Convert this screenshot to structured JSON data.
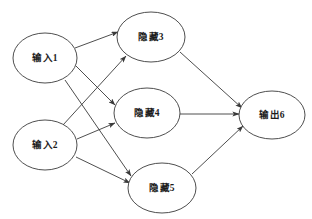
{
  "diagram": {
    "type": "neural-network",
    "title": "",
    "background_color": "#ffffff",
    "stroke_color": "#3a3a3a",
    "text_color": "#1c1c1c",
    "nodes": [
      {
        "id": "n1",
        "label": "输入1",
        "layer": "input",
        "cx": 45,
        "cy": 58,
        "rx": 32,
        "ry": 25
      },
      {
        "id": "n2",
        "label": "输入2",
        "layer": "input",
        "cx": 45,
        "cy": 145,
        "rx": 32,
        "ry": 25
      },
      {
        "id": "n3",
        "label": "隐藏3",
        "layer": "hidden",
        "cx": 151,
        "cy": 37,
        "rx": 34,
        "ry": 25
      },
      {
        "id": "n4",
        "label": "隐藏4",
        "layer": "hidden",
        "cx": 147,
        "cy": 113,
        "rx": 33,
        "ry": 25
      },
      {
        "id": "n5",
        "label": "隐藏5",
        "layer": "hidden",
        "cx": 162,
        "cy": 188,
        "rx": 34,
        "ry": 25
      },
      {
        "id": "n6",
        "label": "输出6",
        "layer": "output",
        "cx": 272,
        "cy": 115,
        "rx": 33,
        "ry": 24
      }
    ],
    "edges": [
      {
        "id": "e1",
        "from": "n1",
        "to": "n3",
        "directed": true
      },
      {
        "id": "e2",
        "from": "n1",
        "to": "n4",
        "directed": true
      },
      {
        "id": "e3",
        "from": "n1",
        "to": "n5",
        "directed": true
      },
      {
        "id": "e4",
        "from": "n2",
        "to": "n3",
        "directed": true
      },
      {
        "id": "e5",
        "from": "n2",
        "to": "n4",
        "directed": true
      },
      {
        "id": "e6",
        "from": "n2",
        "to": "n5",
        "directed": true
      },
      {
        "id": "e7",
        "from": "n3",
        "to": "n6",
        "directed": true
      },
      {
        "id": "e8",
        "from": "n4",
        "to": "n6",
        "directed": true
      },
      {
        "id": "e9",
        "from": "n5",
        "to": "n6",
        "directed": true
      }
    ]
  }
}
